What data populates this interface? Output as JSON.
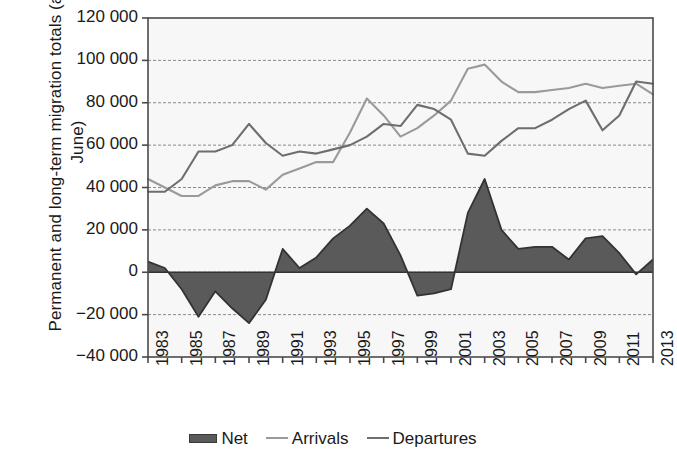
{
  "chart_data": {
    "type": "line",
    "title": "",
    "xlabel": "",
    "ylabel": "Permanent and long-term migration totals (annual June)",
    "ylim": [
      -40000,
      120000
    ],
    "ytick_step": 20000,
    "yticks": [
      "120 000",
      "100 000",
      "80 000",
      "60 000",
      "40 000",
      "20 000",
      "0",
      "−20 000",
      "−40 000"
    ],
    "ytick_values": [
      120000,
      100000,
      80000,
      60000,
      40000,
      20000,
      0,
      -20000,
      -40000
    ],
    "grid": true,
    "grid_style": "dotted-horizontal",
    "legend_position": "bottom",
    "x": [
      1983,
      1984,
      1985,
      1986,
      1987,
      1988,
      1989,
      1990,
      1991,
      1992,
      1993,
      1994,
      1995,
      1996,
      1997,
      1998,
      1999,
      2000,
      2001,
      2002,
      2003,
      2004,
      2005,
      2006,
      2007,
      2008,
      2009,
      2010,
      2011,
      2012,
      2013
    ],
    "xtick_labels": [
      "1983",
      "1985",
      "1987",
      "1989",
      "1991",
      "1993",
      "1995",
      "1997",
      "1999",
      "2001",
      "2003",
      "2005",
      "2007",
      "2009",
      "2011",
      "2013"
    ],
    "xlim": [
      1983,
      2013
    ],
    "series": [
      {
        "name": "Net",
        "kind": "area",
        "color": "#5a5a5a",
        "line_color": "#333333",
        "values": [
          5000,
          2000,
          -8000,
          -21000,
          -9000,
          -17000,
          -24000,
          -13000,
          11000,
          2000,
          7000,
          16000,
          22000,
          30000,
          23000,
          8000,
          -11000,
          -10000,
          -8000,
          28000,
          44000,
          20000,
          11000,
          12000,
          12000,
          6000,
          16000,
          17000,
          9000,
          -1000,
          6000
        ]
      },
      {
        "name": "Arrivals",
        "kind": "line",
        "color": "#9a9a9a",
        "values": [
          44000,
          40000,
          36000,
          36000,
          41000,
          43000,
          43000,
          39000,
          46000,
          49000,
          52000,
          52000,
          66000,
          82000,
          74000,
          64000,
          68000,
          74000,
          81000,
          96000,
          98000,
          90000,
          85000,
          85000,
          86000,
          87000,
          89000,
          87000,
          88000,
          89000,
          84000
        ]
      },
      {
        "name": "Departures",
        "kind": "line",
        "color": "#6e6e6e",
        "values": [
          38000,
          38000,
          44000,
          57000,
          57000,
          60000,
          70000,
          61000,
          55000,
          57000,
          56000,
          58000,
          60000,
          64000,
          70000,
          69000,
          79000,
          77000,
          72000,
          56000,
          55000,
          62000,
          68000,
          68000,
          72000,
          77000,
          81000,
          67000,
          74000,
          90000,
          89000
        ]
      }
    ]
  },
  "legend": {
    "items": [
      {
        "label": "Net",
        "type": "swatch"
      },
      {
        "label": "Arrivals",
        "type": "line"
      },
      {
        "label": "Departures",
        "type": "line"
      }
    ]
  },
  "colors": {
    "net_fill": "#5a5a5a",
    "net_line": "#333333",
    "arrivals": "#9a9a9a",
    "departures": "#6e6e6e",
    "plot_background": "#f7f7f7",
    "axis": "#4a4a4a",
    "grid": "#8a8a8a"
  }
}
